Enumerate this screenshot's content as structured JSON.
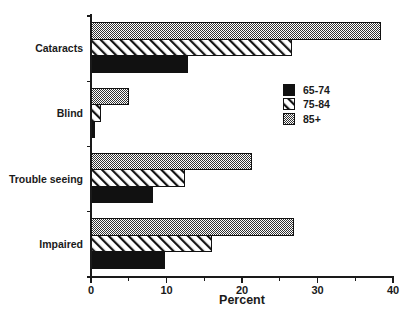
{
  "chart_data": {
    "type": "bar",
    "orientation": "horizontal",
    "title": "",
    "xlabel": "Percent",
    "ylabel": "",
    "xlim": [
      0,
      40
    ],
    "xticks": [
      0,
      10,
      20,
      30,
      40
    ],
    "xtick_labels": [
      "0",
      "10",
      "20",
      "30",
      "40"
    ],
    "xminor_ticks": [
      5,
      15,
      25,
      35
    ],
    "grid": false,
    "legend_position": "center-right",
    "categories": [
      "Cataracts",
      "Blind",
      "Trouble seeing",
      "Impaired"
    ],
    "series": [
      {
        "name": "65-74",
        "values": [
          12.8,
          0.4,
          8.1,
          9.8
        ],
        "fill": "solid-black",
        "color": "#111111"
      },
      {
        "name": "75-84",
        "values": [
          26.6,
          1.3,
          12.4,
          16.0
        ],
        "fill": "diagonal-hatch",
        "color": "#ffffff"
      },
      {
        "name": "85+",
        "values": [
          38.3,
          4.9,
          21.3,
          26.8
        ],
        "fill": "checker-gray",
        "color": "#8a8a8a"
      }
    ]
  },
  "legend": {
    "items": [
      {
        "label": "65-74"
      },
      {
        "label": "75-84"
      },
      {
        "label": "85+"
      }
    ]
  },
  "axis": {
    "x_title": "Percent"
  }
}
